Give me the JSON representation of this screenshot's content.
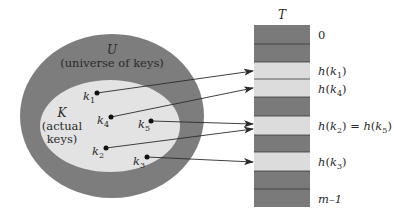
{
  "diagram": {
    "colors": {
      "outer_fill": "#7d7d7d",
      "inner_fill": "#e3e3e3",
      "slot_dark": "#7a7a7a",
      "slot_light": "#dcdcdc",
      "line": "#2a2a2a"
    },
    "universe": {
      "symbol": "U",
      "caption": "(universe of keys)"
    },
    "actual": {
      "symbol": "K",
      "caption_line1": "(actual",
      "caption_line2": "keys)"
    },
    "table": {
      "symbol": "T",
      "slots": [
        {
          "index": 0,
          "filled": false,
          "label": "0"
        },
        {
          "index": 1,
          "filled": false,
          "label": ""
        },
        {
          "index": 2,
          "filled": true,
          "label": "h(k1)"
        },
        {
          "index": 3,
          "filled": true,
          "label": "h(k4)"
        },
        {
          "index": 4,
          "filled": false,
          "label": ""
        },
        {
          "index": 5,
          "filled": true,
          "label": "h(k2) = h(k5)"
        },
        {
          "index": 6,
          "filled": false,
          "label": ""
        },
        {
          "index": 7,
          "filled": true,
          "label": "h(k3)"
        },
        {
          "index": 8,
          "filled": false,
          "label": ""
        },
        {
          "index": 9,
          "filled": false,
          "label": "m–1"
        }
      ]
    },
    "keys": [
      {
        "name": "k1",
        "sub": "1",
        "x": 97,
        "y": 93,
        "target_y": 71
      },
      {
        "name": "k4",
        "sub": "4",
        "x": 111,
        "y": 117,
        "target_y": 88
      },
      {
        "name": "k5",
        "sub": "5",
        "x": 151,
        "y": 121,
        "target_y": 124
      },
      {
        "name": "k2",
        "sub": "2",
        "x": 106,
        "y": 148,
        "target_y": 129
      },
      {
        "name": "k3",
        "sub": "3",
        "x": 147,
        "y": 157,
        "target_y": 162
      }
    ],
    "labels": {
      "k": "k",
      "h": "h",
      "zero": "0",
      "m_minus_1": "m–1",
      "eq": " = "
    }
  }
}
